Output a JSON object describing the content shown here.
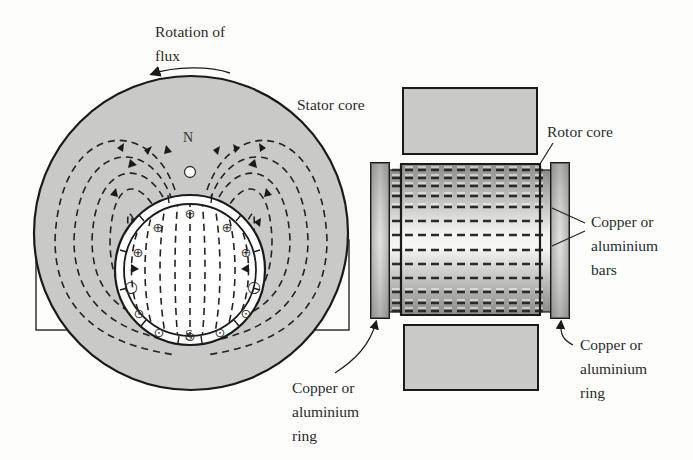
{
  "figure": {
    "left_view": {
      "labels": {
        "rotation_line1": "Rotation of",
        "rotation_line2": "flux",
        "stator_core": "Stator core",
        "north_pole": "N",
        "south_pole": "S"
      },
      "conductor_symbols": {
        "into_page": "⊕",
        "out_of_page": "⊙",
        "neutral": "○"
      }
    },
    "right_view": {
      "labels": {
        "rotor_core": "Rotor core",
        "bars_line1": "Copper or",
        "bars_line2": "aluminium",
        "bars_line3": "bars",
        "left_ring_line1": "Copper or",
        "left_ring_line2": "aluminium",
        "left_ring_line3": "ring",
        "right_ring_line1": "Copper or",
        "right_ring_line2": "aluminium",
        "right_ring_line3": "ring"
      }
    },
    "colors": {
      "stator_fill": "#c9c9c7",
      "outline": "#1a1a1a",
      "rotor_fill": "#ffffff",
      "background": "#fdfdfc"
    }
  }
}
